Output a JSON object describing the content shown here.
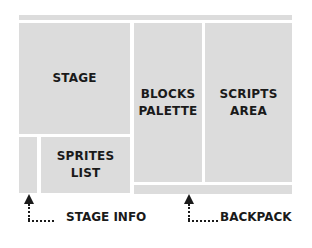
{
  "diagram": {
    "regions": {
      "menu_bar": "",
      "stage": "STAGE",
      "blocks_palette": "BLOCKS PALETTE",
      "scripts_area": "SCRIPTS AREA",
      "stage_info": "",
      "sprites_list": "SPRITES LIST",
      "backpack": ""
    },
    "callouts": {
      "stage_info": "STAGE INFO",
      "backpack": "BACKPACK"
    },
    "colors": {
      "region_fill": "#dcdcdc",
      "text": "#1a1a1a",
      "background": "#ffffff"
    }
  }
}
